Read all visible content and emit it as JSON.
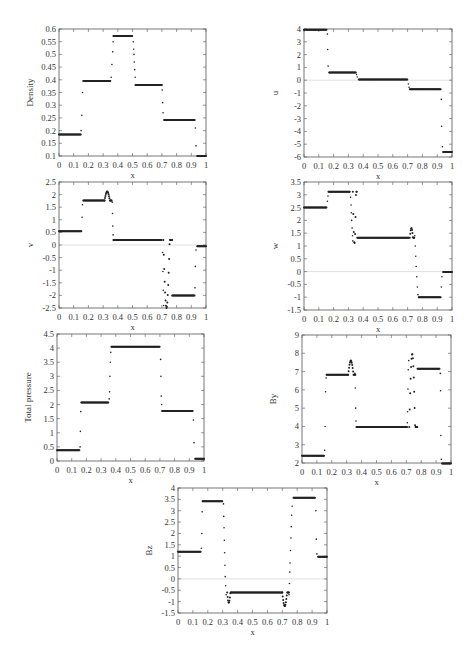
{
  "chart_data": [
    {
      "id": "density",
      "type": "scatter",
      "title": "",
      "xlabel": "x",
      "ylabel": "Density",
      "xlim": [
        0,
        1
      ],
      "ylim": [
        0.1,
        0.6
      ],
      "xticks": [
        "0",
        "0.1",
        "0.2",
        "0.3",
        "0.4",
        "0.5",
        "0.6",
        "0.7",
        "0.8",
        "0.9",
        "1"
      ],
      "yticks": [
        "0.1",
        "0.15",
        "0.2",
        "0.25",
        "0.3",
        "0.35",
        "0.4",
        "0.45",
        "0.5",
        "0.55",
        "0.6"
      ],
      "grid": false,
      "zero_line": false,
      "segments": [
        {
          "x": [
            0.0,
            0.15
          ],
          "y": 0.185
        },
        {
          "x": [
            0.165,
            0.35
          ],
          "y": 0.395
        },
        {
          "x": [
            0.37,
            0.5
          ],
          "y": 0.572
        },
        {
          "x": [
            0.52,
            0.7
          ],
          "y": 0.38
        },
        {
          "x": [
            0.715,
            0.925
          ],
          "y": 0.242
        },
        {
          "x": [
            0.94,
            1.0
          ],
          "y": 0.1
        }
      ],
      "transition_points": [
        [
          0.15,
          0.2
        ],
        [
          0.155,
          0.26
        ],
        [
          0.16,
          0.35
        ],
        [
          0.355,
          0.41
        ],
        [
          0.36,
          0.46
        ],
        [
          0.365,
          0.51
        ],
        [
          0.368,
          0.55
        ],
        [
          0.505,
          0.55
        ],
        [
          0.508,
          0.52
        ],
        [
          0.51,
          0.5
        ],
        [
          0.512,
          0.47
        ],
        [
          0.515,
          0.44
        ],
        [
          0.518,
          0.41
        ],
        [
          0.702,
          0.36
        ],
        [
          0.705,
          0.31
        ],
        [
          0.708,
          0.27
        ],
        [
          0.928,
          0.21
        ],
        [
          0.932,
          0.14
        ]
      ]
    },
    {
      "id": "u",
      "type": "scatter",
      "xlabel": "x",
      "ylabel": "u",
      "xlim": [
        0,
        1
      ],
      "ylim": [
        -6,
        4
      ],
      "xticks": [
        "0",
        "0.1",
        "0.2",
        "0.3",
        "0.4",
        "0.5",
        "0.6",
        "0.7",
        "0.8",
        "0.9",
        "1"
      ],
      "yticks": [
        "-6",
        "-5",
        "-4",
        "-3",
        "-2",
        "-1",
        "0",
        "1",
        "2",
        "3",
        "4"
      ],
      "grid": false,
      "zero_line": true,
      "segments": [
        {
          "x": [
            0.0,
            0.155
          ],
          "y": 3.95
        },
        {
          "x": [
            0.17,
            0.35
          ],
          "y": 0.6
        },
        {
          "x": [
            0.37,
            0.7
          ],
          "y": 0.05
        },
        {
          "x": [
            0.715,
            0.925
          ],
          "y": -0.7
        },
        {
          "x": [
            0.94,
            1.0
          ],
          "y": -5.6
        }
      ],
      "transition_points": [
        [
          0.158,
          3.6
        ],
        [
          0.16,
          2.4
        ],
        [
          0.163,
          1.1
        ],
        [
          0.355,
          0.45
        ],
        [
          0.36,
          0.25
        ],
        [
          0.705,
          -0.3
        ],
        [
          0.71,
          -0.55
        ],
        [
          0.928,
          -1.5
        ],
        [
          0.93,
          -3.6
        ],
        [
          0.935,
          -5.2
        ]
      ]
    },
    {
      "id": "v",
      "type": "scatter",
      "xlabel": "x",
      "ylabel": "v",
      "xlim": [
        0,
        1
      ],
      "ylim": [
        -2.5,
        2.5
      ],
      "xticks": [
        "0",
        "0.1",
        "0.2",
        "0.3",
        "0.4",
        "0.5",
        "0.6",
        "0.7",
        "0.8",
        "0.9",
        "1"
      ],
      "yticks": [
        "-2.5",
        "-2",
        "-1.5",
        "-1",
        "-0.5",
        "0",
        "0.5",
        "1",
        "1.5",
        "2",
        "2.5"
      ],
      "grid": false,
      "zero_line": true,
      "segments": [
        {
          "x": [
            0.0,
            0.155
          ],
          "y": 0.55
        },
        {
          "x": [
            0.165,
            0.31
          ],
          "y": 1.77
        },
        {
          "x": [
            0.37,
            0.7
          ],
          "y": 0.2
        },
        {
          "x": [
            0.77,
            0.925
          ],
          "y": -2.0
        },
        {
          "x": [
            0.94,
            1.0
          ],
          "y": -0.05
        }
      ],
      "bumps": [
        {
          "x": [
            0.31,
            0.36
          ],
          "peak": 2.12
        },
        {
          "x": [
            0.71,
            0.77
          ],
          "trough": -2.5
        }
      ],
      "transition_points": [
        [
          0.157,
          1.1
        ],
        [
          0.16,
          1.6
        ],
        [
          0.362,
          1.7
        ],
        [
          0.364,
          1.25
        ],
        [
          0.366,
          0.75
        ],
        [
          0.368,
          0.4
        ],
        [
          0.705,
          -0.3
        ],
        [
          0.707,
          -1.05
        ],
        [
          0.709,
          -1.8
        ],
        [
          0.712,
          -2.4
        ],
        [
          0.925,
          -1.7
        ],
        [
          0.928,
          -0.85
        ],
        [
          0.932,
          -0.2
        ]
      ]
    },
    {
      "id": "w",
      "type": "scatter",
      "xlabel": "x",
      "ylabel": "w",
      "xlim": [
        0,
        1
      ],
      "ylim": [
        -1.5,
        3.5
      ],
      "xticks": [
        "0",
        "0.1",
        "0.2",
        "0.3",
        "0.4",
        "0.5",
        "0.6",
        "0.7",
        "0.8",
        "0.9",
        "1"
      ],
      "yticks": [
        "-1.5",
        "-1",
        "-0.5",
        "0",
        "0.5",
        "1",
        "1.5",
        "2",
        "2.5",
        "3",
        "3.5"
      ],
      "grid": false,
      "zero_line": true,
      "segments": [
        {
          "x": [
            0.0,
            0.155
          ],
          "y": 2.5
        },
        {
          "x": [
            0.165,
            0.31
          ],
          "y": 3.12
        },
        {
          "x": [
            0.36,
            0.71
          ],
          "y": 1.32
        },
        {
          "x": [
            0.775,
            0.925
          ],
          "y": -1.0
        },
        {
          "x": [
            0.94,
            1.0
          ],
          "y": -0.02
        }
      ],
      "bumps": [
        {
          "x": [
            0.33,
            0.36
          ],
          "trough": 1.08
        },
        {
          "x": [
            0.715,
            0.745
          ],
          "peak": 1.7
        }
      ],
      "transition_points": [
        [
          0.158,
          2.75
        ],
        [
          0.162,
          2.95
        ],
        [
          0.315,
          2.9
        ],
        [
          0.318,
          2.6
        ],
        [
          0.32,
          2.3
        ],
        [
          0.322,
          2.0
        ],
        [
          0.325,
          1.7
        ],
        [
          0.328,
          1.4
        ],
        [
          0.33,
          1.2
        ],
        [
          0.748,
          1.4
        ],
        [
          0.752,
          1.0
        ],
        [
          0.755,
          0.6
        ],
        [
          0.758,
          0.2
        ],
        [
          0.762,
          -0.2
        ],
        [
          0.766,
          -0.6
        ],
        [
          0.77,
          -0.9
        ],
        [
          0.928,
          -0.6
        ],
        [
          0.932,
          -0.2
        ]
      ]
    },
    {
      "id": "total-pressure",
      "type": "scatter",
      "xlabel": "x",
      "ylabel": "Total pressure",
      "xlim": [
        0,
        1
      ],
      "ylim": [
        0,
        4.5
      ],
      "xticks": [
        "0",
        "0.1",
        "0.2",
        "0.3",
        "0.4",
        "0.5",
        "0.6",
        "0.7",
        "0.8",
        "0.9",
        "1"
      ],
      "yticks": [
        "0",
        "0.5",
        "1",
        "1.5",
        "2",
        "2.5",
        "3",
        "3.5",
        "4",
        "4.5"
      ],
      "grid": false,
      "zero_line": false,
      "segments": [
        {
          "x": [
            0.0,
            0.155
          ],
          "y": 0.38
        },
        {
          "x": [
            0.165,
            0.35
          ],
          "y": 2.07
        },
        {
          "x": [
            0.37,
            0.7
          ],
          "y": 4.05
        },
        {
          "x": [
            0.715,
            0.925
          ],
          "y": 1.77
        },
        {
          "x": [
            0.94,
            1.0
          ],
          "y": 0.08
        }
      ],
      "transition_points": [
        [
          0.157,
          0.5
        ],
        [
          0.159,
          1.05
        ],
        [
          0.162,
          1.75
        ],
        [
          0.355,
          2.2
        ],
        [
          0.358,
          2.45
        ],
        [
          0.36,
          3.0
        ],
        [
          0.363,
          3.5
        ],
        [
          0.366,
          3.85
        ],
        [
          0.705,
          3.6
        ],
        [
          0.707,
          3.0
        ],
        [
          0.709,
          2.3
        ],
        [
          0.712,
          2.0
        ],
        [
          0.928,
          1.45
        ],
        [
          0.932,
          0.65
        ]
      ]
    },
    {
      "id": "by",
      "type": "scatter",
      "xlabel": "x",
      "ylabel": "By",
      "xlim": [
        0,
        1
      ],
      "ylim": [
        2,
        9
      ],
      "xticks": [
        "0",
        "0.1",
        "0.2",
        "0.3",
        "0.4",
        "0.5",
        "0.6",
        "0.7",
        "0.8",
        "0.9",
        "1"
      ],
      "yticks": [
        "2",
        "3",
        "4",
        "5",
        "6",
        "7",
        "8",
        "9"
      ],
      "grid": false,
      "zero_line": false,
      "segments": [
        {
          "x": [
            0.0,
            0.15
          ],
          "y": 2.4
        },
        {
          "x": [
            0.165,
            0.31
          ],
          "y": 6.82
        },
        {
          "x": [
            0.365,
            0.705
          ],
          "y": 3.97
        },
        {
          "x": [
            0.775,
            0.925
          ],
          "y": 7.15
        },
        {
          "x": [
            0.94,
            1.0
          ],
          "y": 1.97
        }
      ],
      "bumps": [
        {
          "x": [
            0.31,
            0.36
          ],
          "peak": 7.6
        },
        {
          "x": [
            0.72,
            0.775
          ],
          "peak": 7.97
        }
      ],
      "transition_points": [
        [
          0.152,
          2.7
        ],
        [
          0.155,
          4.0
        ],
        [
          0.158,
          5.9
        ],
        [
          0.162,
          6.65
        ],
        [
          0.355,
          6.9
        ],
        [
          0.358,
          6.1
        ],
        [
          0.36,
          5.0
        ],
        [
          0.362,
          4.3
        ],
        [
          0.707,
          4.2
        ],
        [
          0.709,
          4.8
        ],
        [
          0.711,
          6.05
        ],
        [
          0.713,
          7.1
        ],
        [
          0.716,
          7.6
        ],
        [
          0.928,
          6.9
        ],
        [
          0.93,
          5.95
        ],
        [
          0.932,
          3.5
        ],
        [
          0.935,
          2.2
        ]
      ]
    },
    {
      "id": "bz",
      "type": "scatter",
      "xlabel": "x",
      "ylabel": "Bz",
      "xlim": [
        0,
        1
      ],
      "ylim": [
        -1.5,
        4
      ],
      "xticks": [
        "0",
        "0.1",
        "0.2",
        "0.3",
        "0.4",
        "0.5",
        "0.6",
        "0.7",
        "0.8",
        "0.9",
        "1"
      ],
      "yticks": [
        "-1.5",
        "-1",
        "-0.5",
        "0",
        "0.5",
        "1",
        "1.5",
        "2",
        "2.5",
        "3",
        "3.5",
        "4"
      ],
      "grid": false,
      "zero_line": true,
      "segments": [
        {
          "x": [
            0.0,
            0.155
          ],
          "y": 1.2
        },
        {
          "x": [
            0.165,
            0.3
          ],
          "y": 3.42
        },
        {
          "x": [
            0.36,
            0.7
          ],
          "y": -0.6
        },
        {
          "x": [
            0.775,
            0.92
          ],
          "y": 3.57
        },
        {
          "x": [
            0.94,
            1.0
          ],
          "y": 0.97
        }
      ],
      "bumps": [
        {
          "x": [
            0.33,
            0.36
          ],
          "trough": -1.05
        },
        {
          "x": [
            0.7,
            0.745
          ],
          "trough": -1.2
        }
      ],
      "transition_points": [
        [
          0.157,
          1.35
        ],
        [
          0.16,
          2.0
        ],
        [
          0.162,
          2.95
        ],
        [
          0.305,
          3.3
        ],
        [
          0.307,
          2.75
        ],
        [
          0.309,
          2.25
        ],
        [
          0.311,
          1.7
        ],
        [
          0.313,
          1.15
        ],
        [
          0.315,
          0.6
        ],
        [
          0.317,
          0.1
        ],
        [
          0.32,
          -0.3
        ],
        [
          0.323,
          -0.7
        ],
        [
          0.745,
          -0.7
        ],
        [
          0.748,
          -0.2
        ],
        [
          0.75,
          0.3
        ],
        [
          0.752,
          0.7
        ],
        [
          0.755,
          1.25
        ],
        [
          0.758,
          1.8
        ],
        [
          0.76,
          2.3
        ],
        [
          0.763,
          2.8
        ],
        [
          0.766,
          3.2
        ],
        [
          0.925,
          3.0
        ],
        [
          0.928,
          1.75
        ],
        [
          0.932,
          1.1
        ]
      ]
    }
  ]
}
